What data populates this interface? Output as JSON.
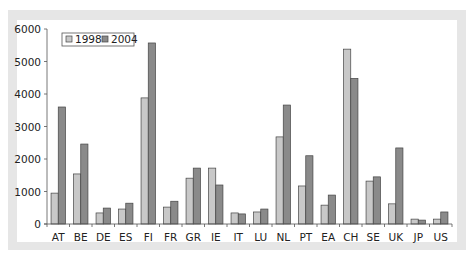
{
  "chart_data": {
    "type": "bar",
    "title": "",
    "xlabel": "",
    "ylabel": "",
    "ylim": [
      0,
      6000
    ],
    "yticks": [
      0,
      1000,
      2000,
      3000,
      4000,
      5000,
      6000
    ],
    "grid": false,
    "legend_position": "top-left",
    "categories": [
      "AT",
      "BE",
      "DE",
      "ES",
      "FI",
      "FR",
      "GR",
      "IE",
      "IT",
      "LU",
      "NL",
      "PT",
      "EA",
      "CH",
      "SE",
      "UK",
      "JP",
      "US"
    ],
    "series": [
      {
        "name": "1998",
        "color": "#c8c8c8",
        "values": [
          950,
          1540,
          340,
          460,
          3880,
          520,
          1410,
          1720,
          340,
          370,
          2680,
          1170,
          580,
          5380,
          1320,
          620,
          150,
          150
        ]
      },
      {
        "name": "2004",
        "color": "#8a8a8a",
        "values": [
          3600,
          2460,
          490,
          640,
          5570,
          700,
          1720,
          1200,
          310,
          460,
          3660,
          2100,
          890,
          4480,
          1450,
          2340,
          120,
          370
        ]
      }
    ]
  },
  "legend": {
    "items": [
      {
        "label": "1998",
        "color": "#c8c8c8"
      },
      {
        "label": "2004",
        "color": "#8a8a8a"
      }
    ]
  },
  "axis": {
    "y_labels": [
      "0",
      "1000",
      "2000",
      "3000",
      "4000",
      "5000",
      "6000"
    ]
  }
}
